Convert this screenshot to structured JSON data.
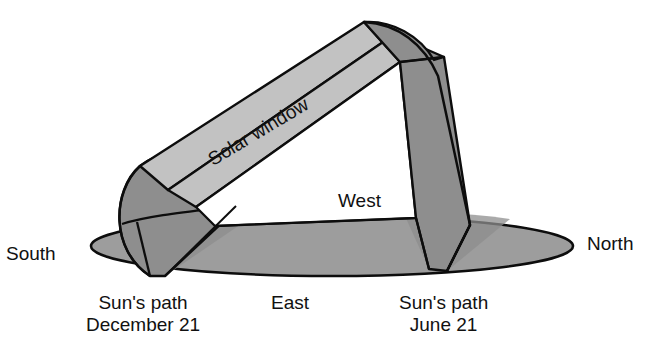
{
  "figure": {
    "labels": {
      "south": "South",
      "north": "North",
      "west": "West",
      "east": "East",
      "solar_window": "Solar window",
      "sun_path": "Sun's path",
      "december_21": "December 21",
      "june_21": "June 21"
    },
    "colors": {
      "background": "#ffffff",
      "outline": "#0d0d0d",
      "light_gray": "#c2c2c2",
      "mid_gray": "#9d9d9d",
      "dark_gray": "#8e8e8e",
      "window_fill": "#ffffff"
    }
  }
}
